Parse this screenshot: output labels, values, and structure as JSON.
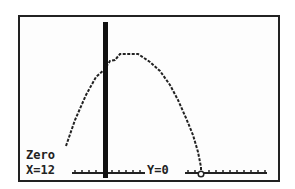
{
  "calculator": {
    "mode": "Zero",
    "x_readout": "X=12",
    "y_readout": "Y=0"
  },
  "graph": {
    "curve": "downward parabola",
    "vertical_line": "bold vertical line",
    "zero_marker": "circle cursor on x-axis",
    "colors": {
      "ink": "#222222",
      "background": "#fdfdfd"
    }
  }
}
